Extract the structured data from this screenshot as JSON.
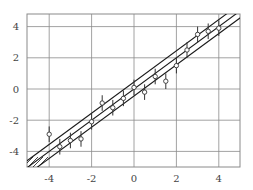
{
  "chart_data": {
    "type": "scatter",
    "title": "",
    "xlabel": "",
    "ylabel": "",
    "xlim": [
      -4.9,
      4.9
    ],
    "ylim": [
      -5,
      4.9
    ],
    "grid": true,
    "x_ticks": [
      -4,
      -2,
      0,
      2,
      4
    ],
    "y_ticks": [
      -4,
      -2,
      0,
      2,
      4
    ],
    "x_tick_labels": [
      "-4",
      "-2",
      "0",
      "2",
      "4"
    ],
    "y_tick_labels": [
      "-4",
      "-2",
      "0",
      "2",
      "4"
    ],
    "series": [
      {
        "name": "measurements",
        "marker": "open-circle",
        "error_bar": 0.5,
        "x": [
          -4,
          -3.5,
          -3,
          -2.5,
          -2,
          -1.5,
          -1,
          -0.5,
          0,
          0.5,
          1,
          1.5,
          2,
          2.5,
          3,
          3.5,
          4
        ],
        "y": [
          -2.9,
          -3.7,
          -3.3,
          -3.2,
          -2.1,
          -0.9,
          -1.2,
          -0.6,
          0.1,
          -0.2,
          0.8,
          0.5,
          1.5,
          2.5,
          3.5,
          3.7,
          3.9
        ]
      }
    ],
    "lines": [
      {
        "name": "upper-band",
        "slope": 1,
        "intercept": 0.45
      },
      {
        "name": "fit",
        "slope": 1,
        "intercept": 0
      },
      {
        "name": "lower-band",
        "slope": 1,
        "intercept": -0.45
      }
    ],
    "legend": null,
    "colors": {
      "grid": "#8a8a8a",
      "lines": "#1a1a1a",
      "markers": "#333333",
      "text": "#444444"
    }
  }
}
